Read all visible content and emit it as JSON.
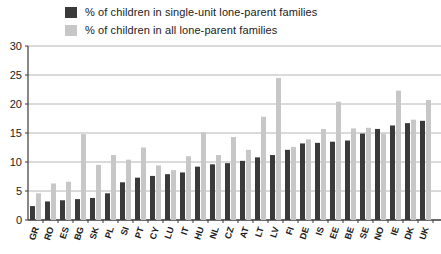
{
  "colors": {
    "dark_series": "#3b3a3a",
    "light_series": "#c7c7c7",
    "grid": "#b6b6b6",
    "axis": "#3a3a3a",
    "text": "#1a1a1a",
    "background": "#ffffff"
  },
  "legend": [
    {
      "label": "% of children in single-unit lone-parent families"
    },
    {
      "label": "% of children in all lone-parent families"
    }
  ],
  "chart_data": {
    "type": "bar",
    "title": "",
    "xlabel": "",
    "ylabel": "",
    "ylim": [
      0,
      30
    ],
    "yticks": [
      0,
      5,
      10,
      15,
      20,
      25,
      30
    ],
    "grid": true,
    "legend_position": "top",
    "categories": [
      "GR",
      "RO",
      "ES",
      "BG",
      "SK",
      "PL",
      "SI",
      "PT",
      "CY",
      "LU",
      "IT",
      "HU",
      "NL",
      "CZ",
      "AT",
      "LT",
      "LV",
      "FI",
      "DE",
      "IS",
      "EE",
      "BE",
      "SE",
      "NO",
      "IE",
      "DK",
      "UK"
    ],
    "series": [
      {
        "name": "% of children in single-unit lone-parent families",
        "color": "#3b3a3a",
        "values": [
          2.4,
          3.2,
          3.4,
          3.6,
          3.8,
          4.6,
          6.5,
          7.3,
          7.6,
          7.9,
          8.2,
          9.2,
          9.6,
          9.8,
          10.2,
          10.8,
          11.2,
          12.1,
          13.2,
          13.3,
          13.5,
          13.7,
          14.9,
          15.7,
          16.3,
          16.7,
          17.1
        ]
      },
      {
        "name": "% of children in all lone-parent families",
        "color": "#c7c7c7",
        "values": [
          4.6,
          6.3,
          6.6,
          14.8,
          9.5,
          11.2,
          10.4,
          12.5,
          9.4,
          8.6,
          11.0,
          15.1,
          11.2,
          14.3,
          12.1,
          17.8,
          24.5,
          12.6,
          13.9,
          15.7,
          20.4,
          15.8,
          15.9,
          14.9,
          22.3,
          17.3,
          20.7
        ]
      }
    ]
  }
}
